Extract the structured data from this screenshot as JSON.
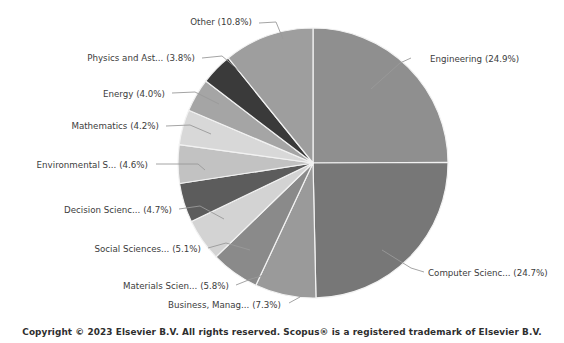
{
  "footer": {
    "copyright": "Copyright © 2023 Elsevier B.V. All rights reserved. Scopus® is a registered trademark of Elsevier B.V."
  },
  "chart_data": {
    "type": "pie",
    "title": "",
    "subtitle": "",
    "xlabel": "",
    "ylabel": "",
    "grid": false,
    "legend": "none",
    "label_format": "{name} ({value}%)",
    "start_angle_deg": 0,
    "direction": "clockwise",
    "center": {
      "x": 313,
      "y": 163
    },
    "radius": 135,
    "categories": [
      "Engineering",
      "Computer Scienc...",
      "Business, Manag...",
      "Materials Scien...",
      "Social Sciences...",
      "Decision Scienc...",
      "Environmental S...",
      "Mathematics",
      "Energy",
      "Physics and Ast...",
      "Other"
    ],
    "values": [
      24.9,
      24.7,
      7.3,
      5.8,
      5.1,
      4.7,
      4.6,
      4.2,
      4.0,
      3.8,
      10.8
    ],
    "colors": [
      "#8f8f8f",
      "#777777",
      "#9a9a9a",
      "#8a8a8a",
      "#d3d3d3",
      "#5c5c5c",
      "#c2c2c2",
      "#d8d8d8",
      "#a5a5a5",
      "#3a3a3a",
      "#9e9e9e"
    ],
    "slices": [
      {
        "name": "Engineering",
        "value": 24.9,
        "label": "Engineering (24.9%)",
        "color": "#8f8f8f",
        "label_x": 430,
        "label_y": 62,
        "label_anchor": "start",
        "leader": "M 411 58 L 400 63 L 371 89"
      },
      {
        "name": "Computer Scienc...",
        "value": 24.7,
        "label": "Computer Scienc... (24.7%)",
        "color": "#777777",
        "label_x": 428,
        "label_y": 276,
        "label_anchor": "start",
        "leader": "M 424 272 L 411 268 L 382 250"
      },
      {
        "name": "Business, Manag...",
        "value": 7.3,
        "label": "Business, Manag... (7.3%)",
        "color": "#9a9a9a",
        "label_x": 281,
        "label_y": 308,
        "label_anchor": "end",
        "leader": "M 289 303 L 300 297 L 303 288"
      },
      {
        "name": "Materials Scien...",
        "value": 5.8,
        "label": "Materials Scien... (5.8%)",
        "color": "#8a8a8a",
        "label_x": 229,
        "label_y": 289,
        "label_anchor": "end",
        "leader": "M 236 285 L 251 279 L 268 274"
      },
      {
        "name": "Social Sciences...",
        "value": 5.1,
        "label": "Social Sciences... (5.1%)",
        "color": "#d3d3d3",
        "label_x": 201,
        "label_y": 252,
        "label_anchor": "end",
        "leader": "M 208 248 L 226 243 L 250 250"
      },
      {
        "name": "Decision Scienc...",
        "value": 4.7,
        "label": "Decision Scienc... (4.7%)",
        "color": "#5c5c5c",
        "label_x": 172,
        "label_y": 213,
        "label_anchor": "end",
        "leader": "M 179 209 L 200 206 L 224 219"
      },
      {
        "name": "Environmental S...",
        "value": 4.6,
        "label": "Environmental S... (4.6%)",
        "color": "#c2c2c2",
        "label_x": 148,
        "label_y": 168,
        "label_anchor": "end",
        "leader": "M 156 164 L 198 164 L 205 170"
      },
      {
        "name": "Mathematics",
        "value": 4.2,
        "label": "Mathematics (4.2%)",
        "color": "#d8d8d8",
        "label_x": 159,
        "label_y": 129,
        "label_anchor": "end",
        "leader": "M 166 126 L 190 125 L 211 134"
      },
      {
        "name": "Energy",
        "value": 4.0,
        "label": "Energy (4.0%)",
        "color": "#a5a5a5",
        "label_x": 165,
        "label_y": 97,
        "label_anchor": "end",
        "leader": "M 172 93 L 195 92 L 219 104"
      },
      {
        "name": "Physics and Ast...",
        "value": 3.8,
        "label": "Physics and Ast... (3.8%)",
        "color": "#3a3a3a",
        "label_x": 195,
        "label_y": 61,
        "label_anchor": "end",
        "leader": "M 202 58 L 222 56 L 241 72"
      },
      {
        "name": "Other",
        "value": 10.8,
        "label": "Other (10.8%)",
        "color": "#9e9e9e",
        "label_x": 252,
        "label_y": 25,
        "label_anchor": "end",
        "leader": "M 259 23 L 276 22 L 283 39"
      }
    ]
  }
}
